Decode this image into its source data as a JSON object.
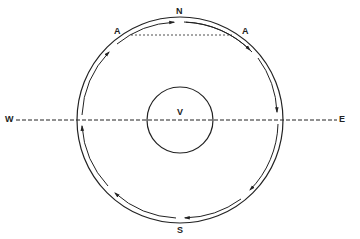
{
  "diagram": {
    "labels": {
      "north": "N",
      "south": "S",
      "west": "W",
      "east": "E",
      "center": "V",
      "a_left": "A",
      "a_right": "A"
    },
    "colors": {
      "stroke": "#222222",
      "background": "#ffffff"
    }
  }
}
